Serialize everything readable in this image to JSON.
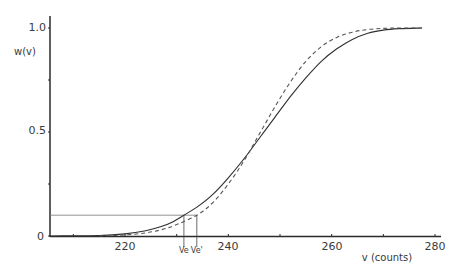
{
  "chart_data": {
    "type": "line",
    "title": "",
    "xlabel": "v (counts)",
    "ylabel": "w(v)",
    "xlim": [
      205.5,
      279
    ],
    "ylim": [
      0,
      1.0
    ],
    "grid": false,
    "legend": null,
    "x_ticks": [
      {
        "value": 210,
        "label": ""
      },
      {
        "value": 220,
        "label": "220"
      },
      {
        "value": 230,
        "label": ""
      },
      {
        "value": 240,
        "label": "240"
      },
      {
        "value": 250,
        "label": ""
      },
      {
        "value": 260,
        "label": "260"
      },
      {
        "value": 270,
        "label": ""
      },
      {
        "value": 280,
        "label": "280"
      }
    ],
    "y_ticks": [
      {
        "value": 0,
        "label": "0"
      },
      {
        "value": 0.25,
        "label": ""
      },
      {
        "value": 0.5,
        "label": "0.5"
      },
      {
        "value": 0.75,
        "label": ""
      },
      {
        "value": 1.0,
        "label": "1.0"
      }
    ],
    "series": [
      {
        "name": "w(v) solid",
        "style": "solid",
        "x": [
          205.5,
          215,
          220,
          224,
          227,
          229,
          231.4,
          234,
          237,
          240,
          243,
          246,
          249,
          252,
          255,
          258,
          261,
          264,
          267,
          270,
          273,
          277.5
        ],
        "y": [
          0.0,
          0.002,
          0.01,
          0.025,
          0.045,
          0.065,
          0.1,
          0.14,
          0.2,
          0.28,
          0.37,
          0.47,
          0.57,
          0.67,
          0.76,
          0.84,
          0.9,
          0.945,
          0.975,
          0.99,
          0.997,
          1.0
        ]
      },
      {
        "name": "w(v) dashed",
        "style": "dashed",
        "x": [
          215,
          220,
          224,
          227,
          230,
          233.9,
          237,
          240,
          243,
          246,
          249,
          252,
          255,
          258,
          261,
          264,
          267,
          270,
          273,
          277.5
        ],
        "y": [
          0.0,
          0.005,
          0.015,
          0.03,
          0.055,
          0.1,
          0.16,
          0.25,
          0.36,
          0.49,
          0.62,
          0.74,
          0.84,
          0.91,
          0.955,
          0.98,
          0.993,
          0.998,
          1.0,
          1.0
        ]
      }
    ],
    "annotations": [
      {
        "type": "hline",
        "y": 0.1,
        "x_from": 205.5,
        "x_to": 233.9,
        "style": "thin"
      },
      {
        "type": "vline",
        "x": 231.4,
        "y_from": 0,
        "y_to": 0.1,
        "label": "Ve"
      },
      {
        "type": "vline",
        "x": 233.9,
        "y_from": 0,
        "y_to": 0.1,
        "label": "Ve'"
      }
    ]
  },
  "labels": {
    "ylabel": "w(v)",
    "xlabel": "v (counts)",
    "ve": "Ve",
    "ve_prime": "Ve'",
    "y_tick_0": "0",
    "y_tick_05": "0.5",
    "y_tick_1": "1.0",
    "x_tick_220": "220",
    "x_tick_240": "240",
    "x_tick_260": "260",
    "x_tick_280": "280"
  }
}
